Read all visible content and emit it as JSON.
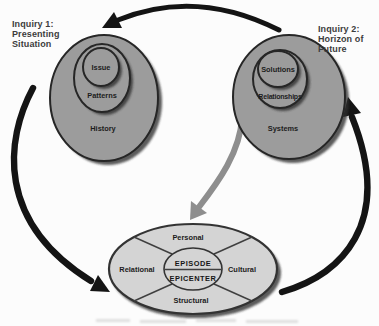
{
  "inquiry1": {
    "line1": "Inquiry 1:",
    "line2": "Presenting",
    "line3": "Situation"
  },
  "inquiry2": {
    "line1": "Inquiry 2:",
    "line2": "Horizon of",
    "line3": "Future"
  },
  "presenting_oval": {
    "inner": "Issue",
    "middle": "Patterns",
    "outer": "History"
  },
  "future_oval": {
    "inner": "Solutions",
    "middle": "Relationships",
    "outer": "Systems"
  },
  "epicenter_ellipse": {
    "top_quadrant": "Personal",
    "right_quadrant": "Cultural",
    "bottom_quadrant": "Structural",
    "left_quadrant": "Relational",
    "center_top": "EPISODE",
    "center_bottom": "EPICENTER"
  },
  "colors": {
    "background": "#fcfcfc",
    "oval_fill": "#9c9c9c",
    "oval_stroke": "#262626",
    "light_ellipse_fill": "#d4d4d4",
    "arrow_black": "#141414",
    "arrow_gray": "#8e8e8e",
    "label_text": "#1c1c1c",
    "inquiry_text": "#3c3c3c"
  }
}
